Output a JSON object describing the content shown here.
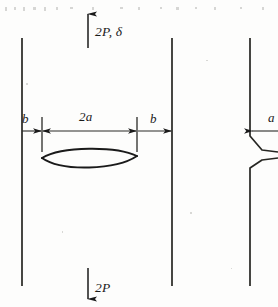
{
  "figure": {
    "kind": "engineering-mechanics-diagram",
    "background_color": "#fdfdfc",
    "ink_color": "#1a1a1a",
    "labels": {
      "top_load": "2P, δ",
      "bottom_load": "2P",
      "half_crack_length": "2a",
      "left_ligament": "b",
      "right_ligament": "b",
      "edge_crack_length": "a"
    },
    "left_panel": {
      "left_boundary_x": 22,
      "right_boundary_x": 172,
      "boundary_top_y": 38,
      "boundary_bottom_y": 286,
      "dimension_line_y": 131,
      "crack_tick_left_x": 42,
      "crack_tick_right_x": 137,
      "crack_center_x": 89,
      "crack_center_y": 157,
      "crack_half_height": 9,
      "top_arrow": {
        "x": 88,
        "y_tail": 48,
        "y_head": 12,
        "direction": "up"
      },
      "bottom_arrow": {
        "x": 88,
        "y_tail": 268,
        "y_head": 301,
        "direction": "down"
      }
    },
    "right_panel": {
      "boundary_x": 250,
      "boundary_top_y": 38,
      "boundary_bottom_y": 286,
      "notch_top_y": 136,
      "notch_bottom_y": 166,
      "dimension_line_y": 131,
      "arrow_head_x": 252,
      "cropped": true
    }
  }
}
